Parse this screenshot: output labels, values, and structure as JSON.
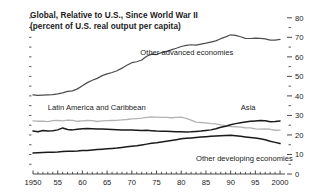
{
  "chart_data": {
    "type": "line",
    "title": "Global, Relative to U.S., Since World War II",
    "subtitle": "(percent of U.S. real output per capita)",
    "xlabel": "",
    "ylabel": "",
    "xlim": [
      1950,
      2001
    ],
    "ylim": [
      0,
      84
    ],
    "grid": false,
    "legend_position": "inline-annotations",
    "y_axis_side": "right",
    "y_ticks": [
      0,
      10,
      20,
      30,
      40,
      50,
      60,
      70,
      80
    ],
    "y_tick_labels": [
      "0",
      "10",
      "20",
      "30",
      "40",
      "50",
      "60",
      "70",
      "80"
    ],
    "y_minor_ticks": [
      5,
      15,
      25,
      35,
      45,
      55,
      65,
      75
    ],
    "x_ticks": [
      1950,
      1955,
      1960,
      1965,
      1970,
      1975,
      1980,
      1985,
      1990,
      1995,
      2000
    ],
    "x_tick_labels": [
      "1950",
      "55",
      "60",
      "65",
      "70",
      "75",
      "80",
      "85",
      "90",
      "95",
      "2000"
    ],
    "series": [
      {
        "name": "Other advanced economies",
        "color": "#4d4d4d",
        "width": 1.25,
        "label_x": 1980,
        "label_y": 61,
        "x": [
          1950,
          1951,
          1952,
          1953,
          1954,
          1955,
          1956,
          1957,
          1958,
          1959,
          1960,
          1961,
          1962,
          1963,
          1964,
          1965,
          1966,
          1967,
          1968,
          1969,
          1970,
          1971,
          1972,
          1973,
          1974,
          1975,
          1976,
          1977,
          1978,
          1979,
          1980,
          1981,
          1982,
          1983,
          1984,
          1985,
          1986,
          1987,
          1988,
          1989,
          1990,
          1991,
          1992,
          1993,
          1994,
          1995,
          1996,
          1997,
          1998,
          1999,
          2000
        ],
        "values": [
          40.5,
          40.3,
          40.4,
          40.5,
          40.6,
          41.0,
          41.6,
          42.3,
          42.6,
          43.6,
          45.2,
          46.8,
          48.0,
          49.0,
          50.4,
          51.3,
          52.0,
          52.9,
          54.2,
          55.7,
          57.0,
          57.5,
          58.4,
          60.3,
          61.4,
          61.2,
          62.2,
          62.8,
          63.6,
          64.4,
          65.3,
          65.9,
          66.2,
          66.0,
          66.5,
          67.0,
          67.6,
          68.2,
          69.3,
          70.2,
          71.3,
          71.0,
          70.3,
          69.5,
          69.4,
          69.6,
          69.5,
          69.2,
          68.6,
          68.6,
          69.0
        ]
      },
      {
        "name": "Latin America and Caribbean",
        "color": "#b3b3b3",
        "width": 1.35,
        "label_x": 1953,
        "label_y": 33,
        "x": [
          1950,
          1951,
          1952,
          1953,
          1954,
          1955,
          1956,
          1957,
          1958,
          1959,
          1960,
          1961,
          1962,
          1963,
          1964,
          1965,
          1966,
          1967,
          1968,
          1969,
          1970,
          1971,
          1972,
          1973,
          1974,
          1975,
          1976,
          1977,
          1978,
          1979,
          1980,
          1981,
          1982,
          1983,
          1984,
          1985,
          1986,
          1987,
          1988,
          1989,
          1990,
          1991,
          1992,
          1993,
          1994,
          1995,
          1996,
          1997,
          1998,
          1999,
          2000
        ],
        "values": [
          27.2,
          27.0,
          27.1,
          26.8,
          27.3,
          27.4,
          27.2,
          27.6,
          27.5,
          27.0,
          27.2,
          27.4,
          27.3,
          26.9,
          27.2,
          27.3,
          27.4,
          27.5,
          27.7,
          27.9,
          28.2,
          28.4,
          28.6,
          29.0,
          29.2,
          29.1,
          29.0,
          29.0,
          28.8,
          29.0,
          29.1,
          28.5,
          27.6,
          26.6,
          26.4,
          26.2,
          25.8,
          25.7,
          25.2,
          24.8,
          24.3,
          24.2,
          24.0,
          23.7,
          23.6,
          23.1,
          23.0,
          23.1,
          22.9,
          22.4,
          22.5
        ]
      },
      {
        "name": "Asia",
        "color": "#1a1a1a",
        "width": 1.5,
        "label_x": 1991,
        "label_y": 33,
        "x": [
          1950,
          1951,
          1952,
          1953,
          1954,
          1955,
          1956,
          1957,
          1958,
          1959,
          1960,
          1961,
          1962,
          1963,
          1964,
          1965,
          1966,
          1967,
          1968,
          1969,
          1970,
          1971,
          1972,
          1973,
          1974,
          1975,
          1976,
          1977,
          1978,
          1979,
          1980,
          1981,
          1982,
          1983,
          1984,
          1985,
          1986,
          1987,
          1988,
          1989,
          1990,
          1991,
          1992,
          1993,
          1994,
          1995,
          1996,
          1997,
          1998,
          1999,
          2000
        ],
        "values": [
          22.0,
          21.6,
          22.3,
          22.0,
          22.2,
          22.6,
          23.6,
          22.8,
          22.6,
          22.9,
          23.2,
          23.3,
          23.2,
          23.1,
          23.0,
          22.9,
          22.8,
          22.7,
          22.6,
          22.6,
          22.5,
          22.4,
          22.3,
          22.4,
          22.2,
          22.0,
          21.9,
          21.9,
          21.8,
          21.7,
          21.6,
          21.5,
          21.6,
          21.8,
          22.0,
          22.3,
          22.6,
          23.2,
          23.9,
          24.5,
          25.2,
          25.8,
          26.2,
          26.6,
          27.0,
          27.2,
          27.4,
          27.3,
          26.8,
          26.9,
          27.2
        ]
      },
      {
        "name": "Other developing economies",
        "color": "#1a1a1a",
        "width": 1.5,
        "label_x": 1983,
        "label_y": 6.5,
        "x": [
          1950,
          1951,
          1952,
          1953,
          1954,
          1955,
          1956,
          1957,
          1958,
          1959,
          1960,
          1961,
          1962,
          1963,
          1964,
          1965,
          1966,
          1967,
          1968,
          1969,
          1970,
          1971,
          1972,
          1973,
          1974,
          1975,
          1976,
          1977,
          1978,
          1979,
          1980,
          1981,
          1982,
          1983,
          1984,
          1985,
          1986,
          1987,
          1988,
          1989,
          1990,
          1991,
          1992,
          1993,
          1994,
          1995,
          1996,
          1997,
          1998,
          1999,
          2000
        ],
        "values": [
          10.8,
          10.9,
          11.0,
          11.1,
          11.2,
          11.3,
          11.5,
          11.6,
          11.7,
          11.8,
          12.0,
          12.1,
          12.3,
          12.5,
          12.7,
          12.9,
          13.1,
          13.3,
          13.6,
          13.9,
          14.2,
          14.5,
          14.9,
          15.3,
          15.7,
          16.0,
          16.4,
          16.8,
          17.2,
          17.6,
          18.0,
          18.3,
          18.5,
          18.7,
          18.9,
          19.1,
          19.3,
          19.5,
          19.6,
          19.7,
          19.8,
          19.6,
          19.3,
          19.0,
          18.7,
          18.4,
          18.0,
          17.5,
          16.8,
          16.2,
          15.6
        ]
      }
    ]
  }
}
